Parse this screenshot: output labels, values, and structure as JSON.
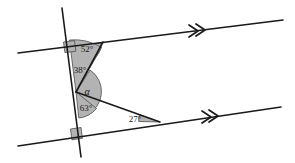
{
  "figure": {
    "type": "geometry-diagram",
    "background_color": "#ffffff",
    "stroke_color": "#1a1a1a",
    "angle_fill_color": "#b3b3b3",
    "angle_stroke_color": "#4d4d4d"
  },
  "labels": {
    "angle_52": "52°",
    "angle_38": "38°",
    "angle_alpha": "α",
    "angle_63": "63°",
    "angle_27": "27°"
  },
  "lines": {
    "top_parallel": {
      "name": "top-parallel-line",
      "x1": 18,
      "y1": 53,
      "x2": 283,
      "y2": 20,
      "marker": "double-chevron",
      "marker_x": 196,
      "marker_y": 31
    },
    "bottom_parallel": {
      "name": "bottom-parallel-line",
      "x1": 18,
      "y1": 146,
      "x2": 281,
      "y2": 107,
      "marker": "double-chevron",
      "marker_x": 209,
      "marker_y": 117
    },
    "transversal": {
      "name": "transversal-line",
      "x1": 62,
      "y1": 8,
      "x2": 81,
      "y2": 157
    },
    "zigzag_upper": {
      "name": "zigzag-upper-segment",
      "x1": 103,
      "y1": 42,
      "x2": 76,
      "y2": 92
    },
    "zigzag_lower": {
      "name": "zigzag-lower-segment",
      "x1": 76,
      "y1": 92,
      "x2": 160,
      "y2": 122
    }
  },
  "angles": [
    {
      "id": "angle-52",
      "label": "52°",
      "vertex_x": 85,
      "vertex_y": 51,
      "label_x": 83,
      "label_y": 47
    },
    {
      "id": "angle-38",
      "label": "38°",
      "vertex_x": 70,
      "vertex_y": 54,
      "label_x": 68,
      "label_y": 68
    },
    {
      "id": "angle-alpha",
      "label": "α",
      "vertex_x": 76,
      "vertex_y": 92,
      "label_x": 86,
      "label_y": 92
    },
    {
      "id": "angle-63",
      "label": "63°",
      "vertex_x": 76,
      "vertex_y": 92,
      "label_x": 84,
      "label_y": 108
    },
    {
      "id": "angle-27",
      "label": "27°",
      "vertex_x": 160,
      "vertex_y": 122,
      "label_x": 133,
      "label_y": 120
    }
  ],
  "right_angle_markers": [
    {
      "id": "right-angle-top",
      "x": 66,
      "y": 44
    },
    {
      "id": "right-angle-bottom",
      "x": 73,
      "y": 131
    }
  ]
}
